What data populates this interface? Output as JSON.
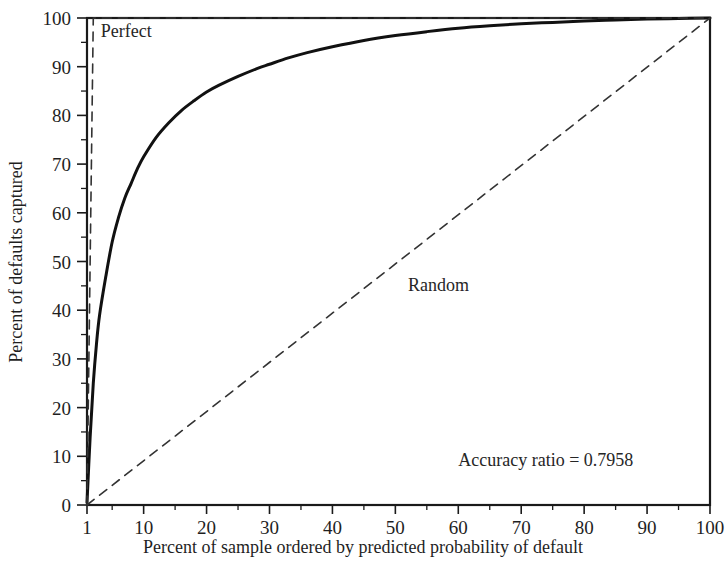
{
  "chart_data": {
    "type": "line",
    "title": "",
    "subtitle": "",
    "xlabel": "Percent of sample ordered by predicted probability of default",
    "ylabel": "Percent of defaults captured",
    "xlim": [
      1,
      100
    ],
    "ylim": [
      0,
      100
    ],
    "grid": false,
    "legend_position": "inline-annotations",
    "x_ticks": [
      1,
      10,
      20,
      30,
      40,
      50,
      60,
      70,
      80,
      90,
      100
    ],
    "x_tick_labels": [
      "1",
      "10",
      "20",
      "30",
      "40",
      "50",
      "60",
      "70",
      "80",
      "90",
      "100"
    ],
    "x_minor_ticks": [
      5,
      15,
      25,
      35,
      45,
      55,
      65,
      75,
      85,
      95
    ],
    "y_ticks": [
      0,
      10,
      20,
      30,
      40,
      50,
      60,
      70,
      80,
      90,
      100
    ],
    "y_tick_labels": [
      "0",
      "10",
      "20",
      "30",
      "40",
      "50",
      "60",
      "70",
      "80",
      "90",
      "100"
    ],
    "y_minor_ticks": [
      5,
      15,
      25,
      35,
      45,
      55,
      65,
      75,
      85,
      95
    ],
    "series": [
      {
        "name": "Model",
        "style": "solid",
        "color": "#111111",
        "width": 3,
        "x": [
          1,
          1.5,
          2,
          2.5,
          3,
          4,
          5,
          6,
          7,
          8,
          9,
          10,
          12,
          14,
          16,
          18,
          20,
          22,
          25,
          28,
          30,
          33,
          36,
          40,
          45,
          50,
          55,
          60,
          65,
          70,
          75,
          80,
          85,
          90,
          95,
          100
        ],
        "values": [
          0.5,
          14,
          25,
          33,
          39,
          47,
          54,
          59,
          63,
          66,
          69,
          71.5,
          75.5,
          78.5,
          81,
          83,
          84.8,
          86.2,
          88,
          89.6,
          90.5,
          91.8,
          92.9,
          94.1,
          95.4,
          96.4,
          97.2,
          97.9,
          98.4,
          98.8,
          99.1,
          99.4,
          99.6,
          99.8,
          99.9,
          100
        ]
      },
      {
        "name": "Perfect",
        "style": "dashed",
        "color": "#333333",
        "width": 1.6,
        "x": [
          1,
          2,
          100
        ],
        "values": [
          0,
          100,
          100
        ]
      },
      {
        "name": "Random",
        "style": "dashed",
        "color": "#333333",
        "width": 1.6,
        "x": [
          1,
          100
        ],
        "values": [
          0,
          100
        ]
      }
    ],
    "annotations": [
      {
        "text": "Perfect",
        "x": 3.2,
        "y": 96.0
      },
      {
        "text": "Random",
        "x": 52.0,
        "y": 44.0
      },
      {
        "text": "Accuracy ratio = 0.7958",
        "x": 60.0,
        "y": 8.0
      }
    ],
    "accuracy_ratio": 0.7958,
    "frame_color": "#1a1a1a",
    "background": "#ffffff"
  }
}
